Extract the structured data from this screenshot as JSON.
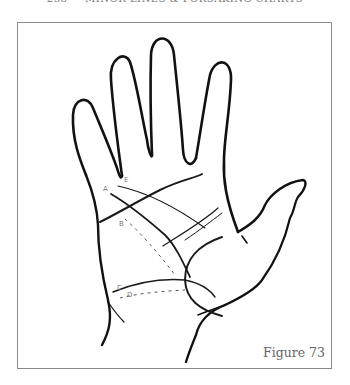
{
  "header": {
    "page_number": "238",
    "running_title": "MINOR LINES & FORSAKING CHARTS"
  },
  "figure": {
    "caption": "Figure 73",
    "line_labels": [
      {
        "id": "A",
        "text": "A"
      },
      {
        "id": "B",
        "text": "B"
      },
      {
        "id": "C",
        "text": "C"
      },
      {
        "id": "D",
        "text": "D"
      },
      {
        "id": "E",
        "text": "E"
      }
    ]
  }
}
